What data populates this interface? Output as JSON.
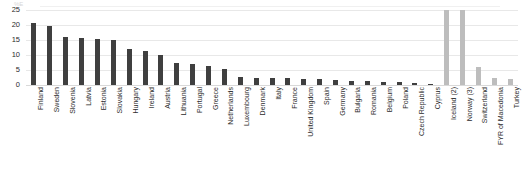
{
  "chart_data": {
    "type": "bar",
    "title": "",
    "subtitle": "",
    "xlabel": "",
    "ylabel": "",
    "ylim": [
      0,
      25
    ],
    "yticks": [
      0,
      5,
      10,
      15,
      20,
      25
    ],
    "grid": true,
    "legend": "none",
    "orientation": "vertical",
    "categories": [
      "Finland",
      "Sweden",
      "Slovenia",
      "Latvia",
      "Estonia",
      "Slovakia",
      "Hungary",
      "Ireland",
      "Austria",
      "Lithuania",
      "Portugal",
      "Greece",
      "Netherlands",
      "Luxembourg",
      "Denmark",
      "Italy",
      "France",
      "United Kingdom",
      "Spain",
      "Germany",
      "Bulgaria",
      "Romania",
      "Belgium",
      "Poland",
      "Czech Republic",
      "Cyprus",
      "Iceland (2)",
      "Norway (3)",
      "Switzerland",
      "FYR of Macedonia",
      "Turkey"
    ],
    "values": [
      20.7,
      19.7,
      16.0,
      15.7,
      15.5,
      14.9,
      11.9,
      11.2,
      10.1,
      7.2,
      7.0,
      6.4,
      5.3,
      2.6,
      2.5,
      2.4,
      2.3,
      2.1,
      1.9,
      1.7,
      1.5,
      1.3,
      1.1,
      0.9,
      0.7,
      0.3,
      25.0,
      25.0,
      6.0,
      2.5,
      2.0
    ],
    "series_groups": [
      {
        "name": "EU member states",
        "color": "#3f3f3f",
        "category_range": [
          0,
          25
        ]
      },
      {
        "name": "Non-EU countries",
        "color": "#bdbdbd",
        "category_range": [
          26,
          30
        ]
      }
    ],
    "bar_colors": [
      "#3f3f3f",
      "#3f3f3f",
      "#3f3f3f",
      "#3f3f3f",
      "#3f3f3f",
      "#3f3f3f",
      "#3f3f3f",
      "#3f3f3f",
      "#3f3f3f",
      "#3f3f3f",
      "#3f3f3f",
      "#3f3f3f",
      "#3f3f3f",
      "#3f3f3f",
      "#3f3f3f",
      "#3f3f3f",
      "#3f3f3f",
      "#3f3f3f",
      "#3f3f3f",
      "#3f3f3f",
      "#3f3f3f",
      "#3f3f3f",
      "#3f3f3f",
      "#3f3f3f",
      "#3f3f3f",
      "#3f3f3f",
      "#bdbdbd",
      "#bdbdbd",
      "#bdbdbd",
      "#bdbdbd",
      "#bdbdbd"
    ]
  },
  "artifact": {
    "fragment": "%E"
  }
}
